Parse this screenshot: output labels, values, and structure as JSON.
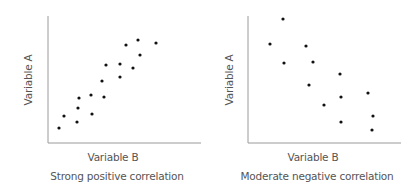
{
  "chart_data": [
    {
      "type": "scatter",
      "title": "Strong positive correlation",
      "xlabel": "Variable B",
      "ylabel": "Variable A",
      "grid": false,
      "legend": null,
      "axis_ticks": false,
      "points_px": [
        [
          59,
          128
        ],
        [
          64,
          116
        ],
        [
          77,
          122
        ],
        [
          78,
          108
        ],
        [
          79,
          98
        ],
        [
          91,
          95
        ],
        [
          92,
          114
        ],
        [
          104,
          97
        ],
        [
          102,
          81
        ],
        [
          106,
          65
        ],
        [
          120,
          64
        ],
        [
          120,
          77
        ],
        [
          126,
          45
        ],
        [
          133,
          68
        ],
        [
          138,
          40
        ],
        [
          140,
          55
        ],
        [
          156,
          43
        ]
      ],
      "axes_px": {
        "x0": 48,
        "y0": 143,
        "x1": 201,
        "ytop": 16
      }
    },
    {
      "type": "scatter",
      "title": "Moderate negative correlation",
      "xlabel": "Variable B",
      "ylabel": "Variable A",
      "grid": false,
      "legend": null,
      "axis_ticks": false,
      "points_px": [
        [
          283,
          19
        ],
        [
          270,
          44
        ],
        [
          284,
          63
        ],
        [
          306,
          46
        ],
        [
          313,
          62
        ],
        [
          309,
          85
        ],
        [
          340,
          74
        ],
        [
          341,
          97
        ],
        [
          324,
          105
        ],
        [
          341,
          122
        ],
        [
          368,
          93
        ],
        [
          373,
          116
        ],
        [
          372,
          130
        ]
      ],
      "axes_px": {
        "x0": 248,
        "y0": 143,
        "x1": 401,
        "ytop": 16
      }
    }
  ],
  "panels": [
    {
      "xlabel": "Variable B",
      "ylabel": "Variable A",
      "caption": "Strong positive correlation"
    },
    {
      "xlabel": "Variable B",
      "ylabel": "Variable A",
      "caption": "Moderate negative correlation"
    }
  ],
  "colors": {
    "axis": "#9a9a9a",
    "point": "#111111",
    "text": "#555555"
  }
}
